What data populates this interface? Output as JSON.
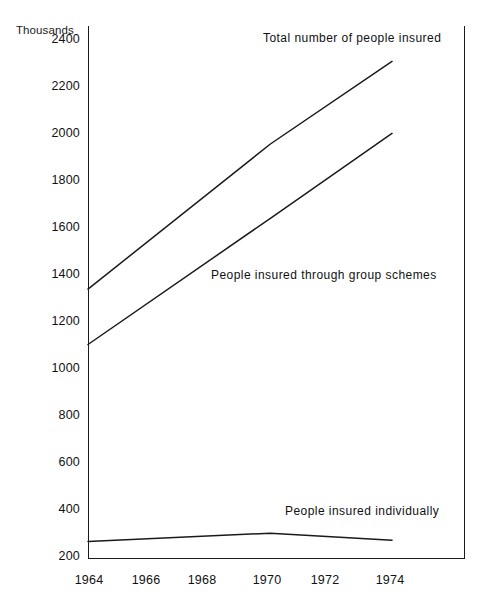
{
  "chart_data": {
    "type": "line",
    "title": "",
    "subtitle": "",
    "xlabel": "",
    "ylabel": "Thousands",
    "unit_label": "Thousands",
    "x": [
      1964,
      1966,
      1968,
      1970,
      1972,
      1974
    ],
    "xlim": [
      1964,
      1974
    ],
    "ylim": [
      200,
      2400
    ],
    "ytick_labels": [
      "2400",
      "2200",
      "2000",
      "1800",
      "1600",
      "1400",
      "1200",
      "1000",
      "800",
      "600",
      "400",
      "200"
    ],
    "ytick_values": [
      2400,
      2200,
      2000,
      1800,
      1600,
      1400,
      1200,
      1000,
      800,
      600,
      400,
      200
    ],
    "xtick_labels": [
      "1964",
      "1966",
      "1968",
      "1970",
      "1972",
      "1974"
    ],
    "xtick_values": [
      1964,
      1966,
      1968,
      1970,
      1972,
      1974
    ],
    "grid": false,
    "legend_position": "inline-annotations",
    "line_color": "#1a1a1a",
    "background_color": "#ffffff",
    "series": [
      {
        "name": "Total number of people insured",
        "annotation": "Total number of people insured",
        "x": [
          1964,
          1970,
          1974
        ],
        "values": [
          1340,
          1955,
          2305
        ]
      },
      {
        "name": "People insured through group schemes",
        "annotation": "People insured through group schemes",
        "x": [
          1964,
          1970,
          1974
        ],
        "values": [
          1105,
          1640,
          2000
        ]
      },
      {
        "name": "People insured individually",
        "annotation": "People insured individually",
        "x": [
          1964,
          1970,
          1974
        ],
        "values": [
          270,
          305,
          275
        ]
      }
    ]
  },
  "annotations": {
    "total": "Total number of people insured",
    "group": "People insured through group schemes",
    "individual": "People insured individually"
  }
}
